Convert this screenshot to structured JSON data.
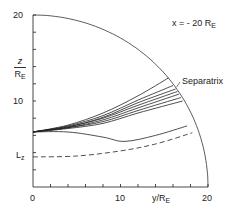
{
  "chart_data": {
    "type": "line",
    "annotation": {
      "text": "x = - 20 R",
      "subscript": "E"
    },
    "xlabel": {
      "text": "y/R",
      "subscript": "E"
    },
    "ylabel": {
      "top": "z",
      "bottom": "R",
      "subscript": "E"
    },
    "xlim": [
      0,
      20
    ],
    "ylim": [
      0,
      20
    ],
    "x_ticks": [
      "0",
      "10",
      "20"
    ],
    "y_ticks": [
      "10",
      "20"
    ],
    "special_label": {
      "text": "L",
      "subscript": "z",
      "value": 3.5
    },
    "separatrix_label": "Separatrix",
    "boundary": {
      "type": "circular-arc",
      "radius": 20,
      "description": "magnetopause quarter circle"
    },
    "grid": false,
    "series": [
      {
        "name": "field line 1",
        "style": "solid",
        "points": [
          [
            0,
            6.4
          ],
          [
            4,
            7.2
          ],
          [
            8,
            8.6
          ],
          [
            12,
            10.6
          ],
          [
            15.5,
            12.7
          ]
        ]
      },
      {
        "name": "field line 2",
        "style": "solid",
        "points": [
          [
            0,
            6.4
          ],
          [
            4,
            7.1
          ],
          [
            8,
            8.3
          ],
          [
            12,
            10.1
          ],
          [
            16,
            11.8
          ]
        ]
      },
      {
        "name": "field line 3",
        "style": "solid",
        "points": [
          [
            0,
            6.4
          ],
          [
            4,
            7.0
          ],
          [
            8,
            8.1
          ],
          [
            12,
            9.8
          ],
          [
            16.3,
            11.4
          ]
        ]
      },
      {
        "name": "field line 4",
        "style": "solid",
        "points": [
          [
            0,
            6.4
          ],
          [
            4,
            7.0
          ],
          [
            8,
            8.0
          ],
          [
            12,
            9.5
          ],
          [
            16.5,
            11.1
          ]
        ]
      },
      {
        "name": "field line 5",
        "style": "solid",
        "points": [
          [
            0,
            6.4
          ],
          [
            4,
            6.9
          ],
          [
            8,
            7.8
          ],
          [
            12,
            9.2
          ],
          [
            16.7,
            10.8
          ]
        ]
      },
      {
        "name": "field line 6",
        "style": "solid",
        "points": [
          [
            0,
            6.4
          ],
          [
            4,
            6.9
          ],
          [
            8,
            7.6
          ],
          [
            12,
            8.9
          ],
          [
            16.9,
            10.4
          ]
        ]
      },
      {
        "name": "field line 7",
        "style": "solid",
        "points": [
          [
            0,
            6.4
          ],
          [
            4,
            6.8
          ],
          [
            8,
            7.4
          ],
          [
            12,
            8.6
          ],
          [
            17.1,
            10.0
          ]
        ]
      },
      {
        "name": "field line 8",
        "style": "solid",
        "points": [
          [
            0,
            6.4
          ],
          [
            4,
            6.4
          ],
          [
            8,
            5.8
          ],
          [
            10.5,
            5.3
          ],
          [
            14,
            6.0
          ],
          [
            17.6,
            7.1
          ]
        ]
      },
      {
        "name": "L_z boundary",
        "style": "dashed",
        "points": [
          [
            0,
            3.5
          ],
          [
            5,
            3.6
          ],
          [
            10,
            4.2
          ],
          [
            14,
            5.0
          ],
          [
            18.2,
            6.3
          ]
        ]
      }
    ]
  }
}
